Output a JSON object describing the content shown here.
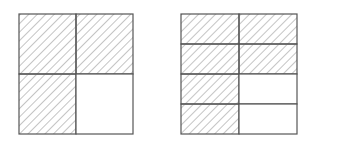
{
  "figures": [
    {
      "name": "left-square",
      "description": "Square divided into 2x2 grid; 3 of 4 cells shaded",
      "rows": 2,
      "cols": 2,
      "shaded": [
        [
          true,
          true
        ],
        [
          true,
          false
        ]
      ],
      "x": 19,
      "y": 14,
      "width": 114,
      "height": 120
    },
    {
      "name": "right-square",
      "description": "Square divided into 4 rows x 2 cols grid; 6 of 8 cells shaded",
      "rows": 4,
      "cols": 2,
      "shaded": [
        [
          true,
          true
        ],
        [
          true,
          true
        ],
        [
          true,
          false
        ],
        [
          true,
          false
        ]
      ],
      "x": 181,
      "y": 14,
      "width": 116,
      "height": 120
    }
  ],
  "colors": {
    "line": "#555555",
    "hatch": "#8a8a8a",
    "background": "#ffffff"
  }
}
